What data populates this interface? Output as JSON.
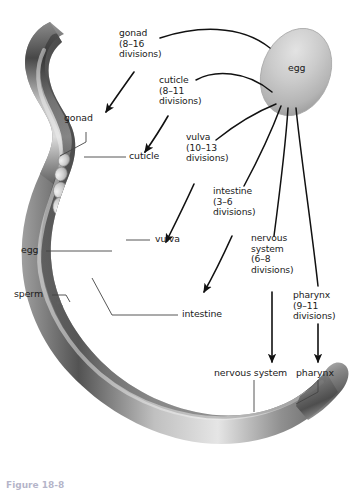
{
  "figure": {
    "background_color": "#ffffff",
    "text_color": "#1a1a1a",
    "caption": "Figure 18-8"
  },
  "organism": {
    "egg_label": "egg",
    "egg_fill": "#c9c9c9",
    "worm_fill": "#6e6e6e"
  },
  "division_labels": [
    {
      "name": "gonad",
      "line1": "gonad",
      "line2": "(8–16",
      "line3": "divisions)"
    },
    {
      "name": "cuticle",
      "line1": "cuticle",
      "line2": "(8–11",
      "line3": "divisions)"
    },
    {
      "name": "vulva",
      "line1": "vulva",
      "line2": "(10–13",
      "line3": "divisions)"
    },
    {
      "name": "intestine",
      "line1": "intestine",
      "line2": "(3–6",
      "line3": "divisions)"
    },
    {
      "name": "nervous-system",
      "line1": "nervous",
      "line2": "system",
      "line3": "(6–8",
      "line4": "divisions)"
    },
    {
      "name": "pharynx",
      "line1": "pharynx",
      "line2": "(9–11",
      "line3": "divisions)"
    }
  ],
  "anatomy_labels": [
    {
      "name": "gonad",
      "text": "gonad"
    },
    {
      "name": "cuticle",
      "text": "cuticle"
    },
    {
      "name": "egg",
      "text": "egg"
    },
    {
      "name": "vulva",
      "text": "vulva"
    },
    {
      "name": "sperm",
      "text": "sperm"
    },
    {
      "name": "intestine",
      "text": "intestine"
    },
    {
      "name": "nervous-system",
      "text": "nervous system"
    },
    {
      "name": "pharynx",
      "text": "pharynx"
    }
  ]
}
